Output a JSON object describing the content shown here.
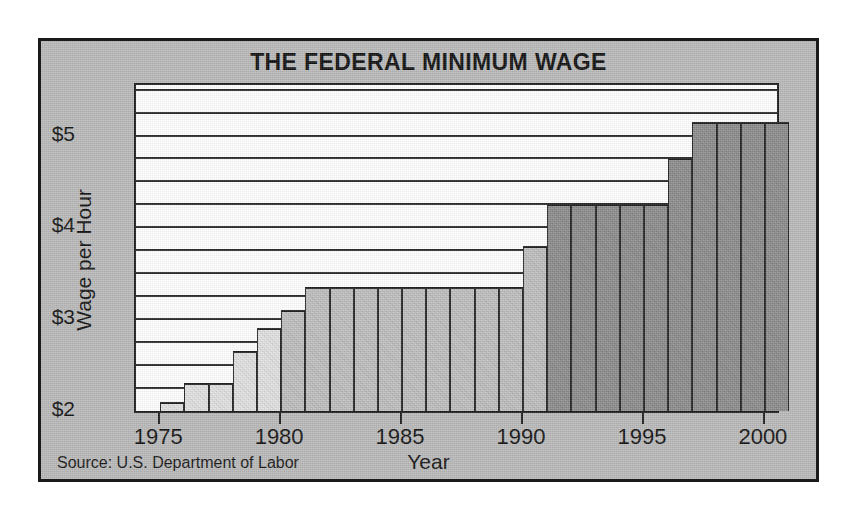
{
  "chart_data": {
    "type": "bar",
    "title": "THE FEDERAL MINIMUM WAGE",
    "xlabel": "Year",
    "ylabel": "Wage per Hour",
    "source": "Source: U.S. Department of Labor",
    "ylim": [
      2.0,
      5.55
    ],
    "xlim": [
      1974,
      2000.5
    ],
    "grid": true,
    "gridline_step": 0.25,
    "legend": "none",
    "ytick_labels": [
      "$2",
      "$3",
      "$4",
      "$5"
    ],
    "ytick_values": [
      2,
      3,
      4,
      5
    ],
    "xtick_labels": [
      "1975",
      "1980",
      "1985",
      "1990",
      "1995",
      "2000"
    ],
    "xtick_values": [
      1975,
      1980,
      1985,
      1990,
      1995,
      2000
    ],
    "categories": [
      1975,
      1976,
      1977,
      1978,
      1979,
      1980,
      1981,
      1982,
      1983,
      1984,
      1985,
      1986,
      1987,
      1988,
      1989,
      1990,
      1991,
      1992,
      1993,
      1994,
      1995,
      1996,
      1997,
      1998,
      1999,
      2000
    ],
    "values": [
      2.1,
      2.3,
      2.3,
      2.65,
      2.9,
      3.1,
      3.35,
      3.35,
      3.35,
      3.35,
      3.35,
      3.35,
      3.35,
      3.35,
      3.35,
      3.8,
      4.25,
      4.25,
      4.25,
      4.25,
      4.25,
      4.75,
      5.15,
      5.15,
      5.15,
      5.15
    ],
    "bar_shades": [
      "light",
      "light",
      "light",
      "light",
      "light",
      "mid",
      "mid",
      "mid",
      "mid",
      "mid",
      "mid",
      "mid",
      "mid",
      "mid",
      "mid",
      "mid",
      "dark",
      "dark",
      "dark",
      "dark",
      "dark",
      "dark",
      "dark",
      "dark",
      "dark",
      "dark"
    ],
    "colors": {
      "light": "#e3e3e3",
      "mid": "#c0c0c0",
      "dark": "#8e8e8e",
      "plot_background": "#ffffff",
      "figure_background": "#b9b9b9",
      "ink": "#1a1a1a"
    }
  }
}
